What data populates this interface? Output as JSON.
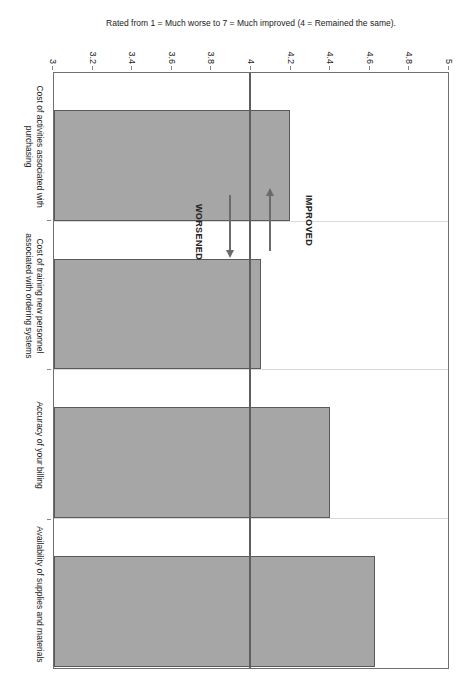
{
  "chart_data": {
    "type": "bar",
    "title": "",
    "orientation": "horizontal-rotated",
    "categories": [
      "Cost of activities associated with purchasing",
      "Cost of training new personnel associated with ordering systems",
      "Accuracy of your billing",
      "Availability of supplies and materials"
    ],
    "values": [
      4.2,
      4.05,
      4.4,
      4.63
    ],
    "xlabel": "Rated from 1 = Much worse to 7 = Much improved (4 = Remained the same).",
    "ylabel": "",
    "xlim": [
      3,
      5
    ],
    "baseline": 3,
    "reference_line": 4,
    "ticks": [
      "5",
      "4.8",
      "4.6",
      "4.4",
      "4.2",
      "4",
      "3.8",
      "3.6",
      "3.4",
      "3.2",
      "3"
    ],
    "tick_values": [
      5,
      4.8,
      4.6,
      4.4,
      4.2,
      4,
      3.8,
      3.6,
      3.4,
      3.2,
      3
    ],
    "grid": true,
    "legend": "none",
    "bar_color": "#a6a6a6",
    "bar_border_color": "#5a5a5a",
    "gridline_color": "#d9d9d9",
    "reference_line_color": "#5e5e5e",
    "annotations": [
      {
        "label": "IMPROVED",
        "direction": "left",
        "from": 4
      },
      {
        "label": "WORSENED",
        "direction": "right",
        "from": 4
      }
    ]
  }
}
